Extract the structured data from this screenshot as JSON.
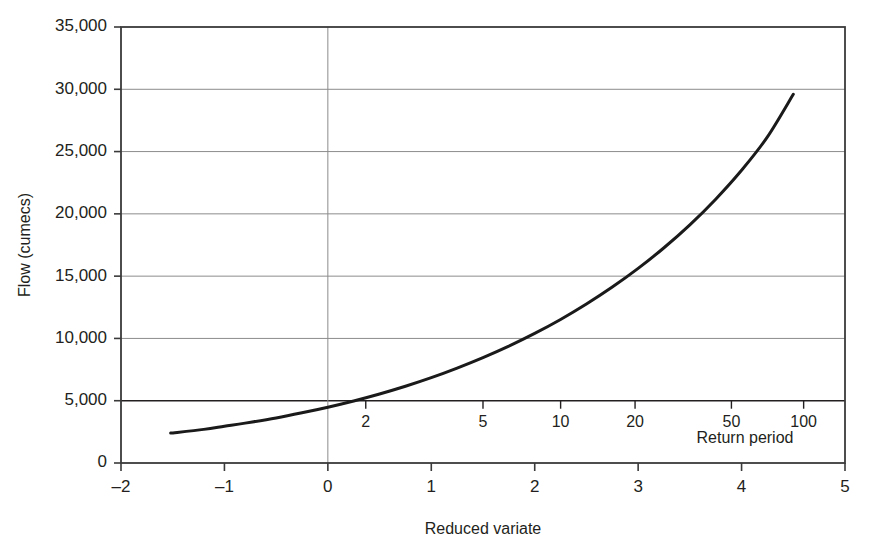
{
  "chart_data": {
    "type": "line",
    "title": "",
    "xlabel": "Reduced variate",
    "ylabel": "Flow (cumecs)",
    "xlim": [
      -2,
      5
    ],
    "ylim": [
      0,
      35000
    ],
    "grid": true,
    "legend": null,
    "x_ticks": [
      "-2",
      "-1",
      "0",
      "1",
      "2",
      "3",
      "4",
      "5"
    ],
    "x_tick_values": [
      -2,
      -1,
      0,
      1,
      2,
      3,
      4,
      5
    ],
    "y_ticks": [
      "0",
      "5,000",
      "10,000",
      "15,000",
      "20,000",
      "25,000",
      "30,000",
      "35,000"
    ],
    "y_tick_values": [
      0,
      5000,
      10000,
      15000,
      20000,
      25000,
      30000,
      35000
    ],
    "secondary_axis": {
      "label": "Return period",
      "position_y_value": 5000,
      "ticks": [
        "2",
        "5",
        "10",
        "20",
        "50",
        "100"
      ],
      "tick_values": [
        2,
        5,
        10,
        20,
        50,
        100
      ],
      "tick_reduced_variate": [
        0.3665,
        1.4999,
        2.2504,
        2.9702,
        3.9019,
        4.6001
      ]
    },
    "series": [
      {
        "name": "Flood frequency curve",
        "color": "#1a1a1a",
        "x": [
          -1.52,
          -1.2,
          -1.0,
          -0.8,
          -0.5,
          -0.25,
          0.0,
          0.25,
          0.5,
          0.75,
          1.0,
          1.25,
          1.5,
          1.75,
          2.0,
          2.25,
          2.5,
          2.75,
          3.0,
          3.25,
          3.5,
          3.75,
          4.0,
          4.25,
          4.5
        ],
        "y": [
          2400,
          2700,
          2950,
          3200,
          3620,
          4030,
          4480,
          4980,
          5540,
          6160,
          6850,
          7620,
          8460,
          9380,
          10400,
          11520,
          12760,
          14120,
          15620,
          17280,
          19120,
          21180,
          23500,
          26180,
          29600
        ]
      }
    ],
    "gridline_style": {
      "minor_color": "#8c8c8c",
      "major_color": "#231f20",
      "frame_color": "#3a3a3a"
    }
  },
  "geometry": {
    "plot_left": 121,
    "plot_right": 845,
    "plot_top": 27,
    "plot_bottom": 463
  }
}
